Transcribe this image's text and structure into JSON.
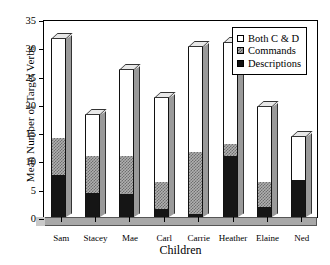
{
  "chart_data": {
    "type": "bar",
    "subtype": "stacked-3d-column",
    "title": "",
    "xlabel": "Children",
    "ylabel": "Mean Number of Target Verbs",
    "categories": [
      "Sam",
      "Stacey",
      "Mae",
      "Carl",
      "Carrie",
      "Heather",
      "Elaine",
      "Ned"
    ],
    "ylim": [
      0,
      35
    ],
    "yticks": [
      0,
      5,
      10,
      15,
      20,
      25,
      30,
      35
    ],
    "ytick_labels": [
      "0",
      "5",
      "10",
      "15",
      "20",
      "25",
      "30",
      "35"
    ],
    "grid": false,
    "legend_position": "top-right",
    "series": [
      {
        "name": "Descriptions",
        "color": "#151515",
        "values": [
          7.5,
          4.2,
          4.1,
          1.4,
          0.6,
          10.7,
          1.8,
          6.5
        ]
      },
      {
        "name": "Commands",
        "color": "#b0b0b0",
        "values": [
          6.5,
          6.5,
          6.7,
          4.8,
          10.9,
          2.2,
          4.4,
          0
        ]
      },
      {
        "name": "Both C & D",
        "color": "#ffffff",
        "values": [
          17.5,
          7.3,
          15.2,
          14.8,
          18.5,
          17.8,
          13.2,
          7.7
        ]
      }
    ],
    "totals": [
      31.5,
      18.0,
      26.0,
      21.0,
      30.0,
      30.7,
      19.4,
      14.2
    ],
    "stack_order_bottom_to_top": [
      "Descriptions",
      "Commands",
      "Both C & D"
    ]
  },
  "legend": {
    "entries": [
      {
        "label": "Both C & D",
        "swatch": "white-square-icon"
      },
      {
        "label": "Commands",
        "swatch": "hatched-square-icon"
      },
      {
        "label": "Descriptions",
        "swatch": "black-square-icon"
      }
    ]
  }
}
